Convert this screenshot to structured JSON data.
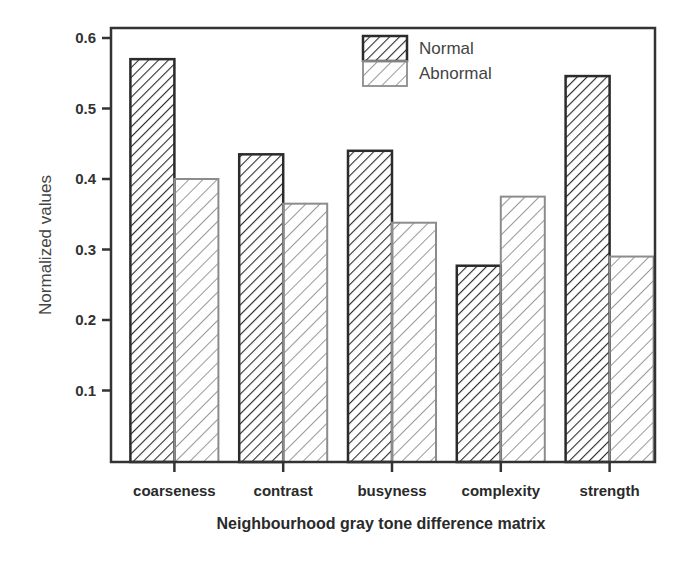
{
  "chart_data": {
    "type": "bar",
    "title": "",
    "xlabel": "Neighbourhood gray tone difference matrix",
    "ylabel": "Normalized values",
    "categories": [
      "coarseness",
      "contrast",
      "busyness",
      "complexity",
      "strength"
    ],
    "series": [
      {
        "name": "Normal",
        "values": [
          0.57,
          0.435,
          0.44,
          0.277,
          0.546
        ],
        "stroke": "#2b2b2b",
        "hatch": "#2b2b2b"
      },
      {
        "name": "Abnormal",
        "values": [
          0.4,
          0.365,
          0.338,
          0.375,
          0.29
        ],
        "stroke": "#8c8c8c",
        "hatch": "#8c8c8c"
      }
    ],
    "ylim": [
      0,
      0.615
    ],
    "yticks": [
      0.1,
      0.2,
      0.3,
      0.4,
      0.5,
      0.6
    ],
    "ytick_labels": [
      "0.1",
      "0.2",
      "0.3",
      "0.4",
      "0.5",
      "0.6"
    ],
    "grid": false,
    "legend_position": "upper center-right, inside plot"
  }
}
